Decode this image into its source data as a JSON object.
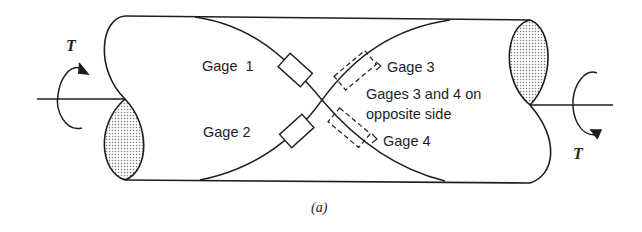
{
  "figure": {
    "caption": "(a)",
    "torque_left_label": "T",
    "torque_right_label": "T",
    "gages": {
      "gage1": "Gage  1",
      "gage2": "Gage 2",
      "gage3": "Gage 3",
      "gage4": "Gage 4"
    },
    "note_line1": "Gages 3 and 4 on",
    "note_line2": "opposite side"
  },
  "colors": {
    "stroke": "#1e1e1e",
    "background": "#ffffff",
    "hatch": "#8a8a8a"
  }
}
